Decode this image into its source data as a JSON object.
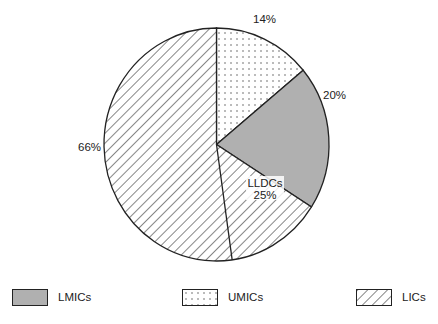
{
  "chart_data": {
    "type": "pie",
    "title": "",
    "slices": [
      {
        "label": "UMICs",
        "value": 14,
        "display": "14%",
        "pattern": "dots"
      },
      {
        "label": "LMICs",
        "value": 20,
        "display": "20%",
        "pattern": "gray"
      },
      {
        "label": "LICs",
        "value": 66,
        "display": "66%",
        "pattern": "hatch"
      }
    ],
    "sub_slice": {
      "label": "LLDCs",
      "value": 25,
      "display": "25%",
      "parent": "LICs",
      "pattern": "hatch"
    },
    "start_angle_deg": 0,
    "direction": "clockwise",
    "legend_position": "bottom"
  },
  "colors": {
    "gray_fill": "#b0b0b0",
    "stroke": "#222222",
    "background": "#ffffff"
  },
  "labels": {
    "umics_pct": "14%",
    "lmics_pct": "20%",
    "lics_pct": "66%",
    "lldcs_name": "LLDCs",
    "lldcs_pct": "25%"
  },
  "legend": {
    "items": [
      {
        "label": "LMICs",
        "pattern": "gray"
      },
      {
        "label": "UMICs",
        "pattern": "dots"
      },
      {
        "label": "LICs",
        "pattern": "hatch"
      }
    ]
  }
}
